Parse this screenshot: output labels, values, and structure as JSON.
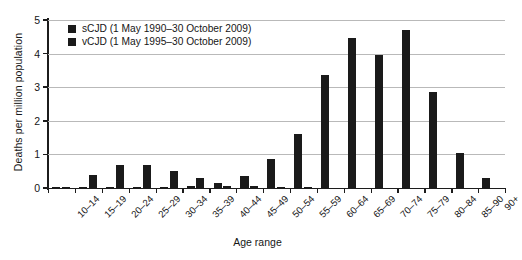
{
  "chart_data": {
    "type": "bar",
    "title": "",
    "xlabel": "Age range",
    "ylabel": "Deaths per million population",
    "ylim": [
      0,
      5
    ],
    "yticks": [
      0,
      1,
      2,
      3,
      4,
      5
    ],
    "ytick_labels": [
      "0",
      "1",
      "2",
      "3",
      "4",
      "5"
    ],
    "grid": true,
    "legend_position": "top-left",
    "bar_color": "#1a1a1a",
    "categories": [
      "10–14",
      "15–19",
      "20–24",
      "25–29",
      "30–34",
      "35–39",
      "40–44",
      "45–49",
      "50–54",
      "55–59",
      "60–64",
      "65–69",
      "70–74",
      "75–79",
      "80–84",
      "85–90",
      "90+"
    ],
    "series": [
      {
        "name": "sCJD (1 May 1990–30 October 2009)",
        "values": [
          0.02,
          0.02,
          0.03,
          0.03,
          0.04,
          0.05,
          0.15,
          0.37,
          0.85,
          1.6,
          3.35,
          4.45,
          3.95,
          4.7,
          2.85,
          1.05,
          0.3
        ]
      },
      {
        "name": "vCJD (1 May 1995–30 October 2009)",
        "values": [
          0.03,
          0.4,
          0.68,
          0.68,
          0.5,
          0.3,
          0.05,
          0.06,
          0.04,
          0.02,
          0.0,
          0.0,
          0.0,
          0.0,
          0.0,
          0.0,
          0.0
        ]
      }
    ]
  },
  "legend": {
    "items": [
      {
        "label": "sCJD (1 May 1990–30 October 2009)"
      },
      {
        "label": "vCJD (1 May 1995–30 October 2009)"
      }
    ]
  }
}
